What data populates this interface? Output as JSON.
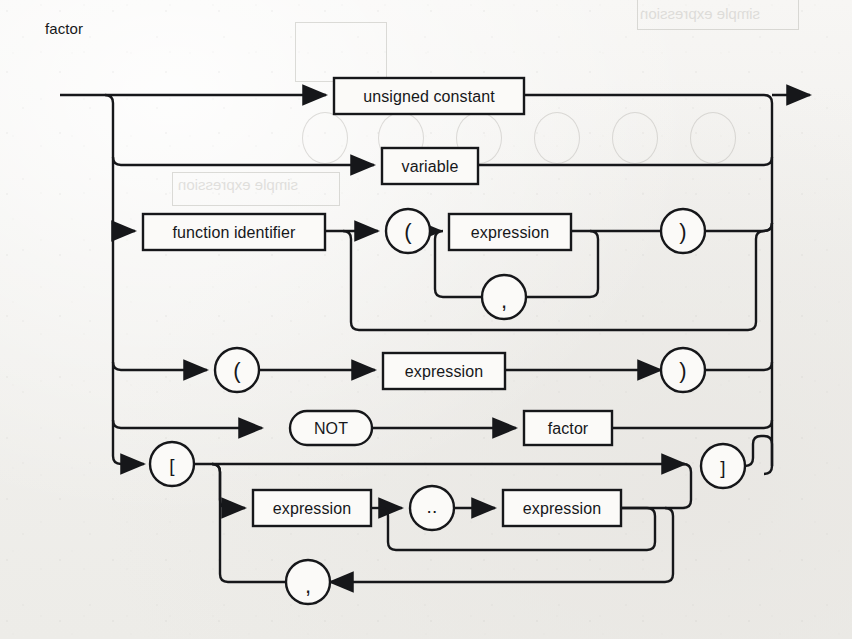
{
  "diagram": {
    "type": "syntax-railroad-diagram",
    "title": "factor",
    "title_pos": {
      "x": 45,
      "y": 27
    },
    "canvas": {
      "width": 852,
      "height": 639
    },
    "ink_color": "#16171a",
    "paper_color": "#f2f2f0",
    "entry": {
      "x": 60,
      "y": 95
    },
    "exit": {
      "x": 818,
      "y": 95
    },
    "left_rail_x": 113,
    "right_rail_x": 772,
    "alternatives": [
      {
        "id": "alt-unsigned-constant",
        "row_y": 95,
        "label": "unsigned constant"
      },
      {
        "id": "alt-variable",
        "row_y": 165,
        "label": "variable"
      },
      {
        "id": "alt-function-call",
        "row_y": 231,
        "label": "function identifier"
      },
      {
        "id": "alt-paren-expression",
        "row_y": 370,
        "label": "expression"
      },
      {
        "id": "alt-not-factor",
        "row_y": 428,
        "label": "NOT"
      },
      {
        "id": "alt-set-constructor",
        "row_y": 464,
        "label": "["
      }
    ],
    "nodes": [
      {
        "id": "node-unsigned-constant",
        "kind": "box",
        "label": "unsigned constant",
        "x": 334,
        "y": 78,
        "w": 190,
        "h": 36
      },
      {
        "id": "node-variable",
        "kind": "box",
        "label": "variable",
        "x": 382,
        "y": 148,
        "w": 96,
        "h": 36
      },
      {
        "id": "node-function-identifier",
        "kind": "box",
        "label": "function identifier",
        "x": 143,
        "y": 214,
        "w": 182,
        "h": 36
      },
      {
        "id": "node-lparen-call",
        "kind": "circle",
        "label": "(",
        "cx": 408,
        "cy": 231,
        "r": 22
      },
      {
        "id": "node-expression-arg",
        "kind": "box",
        "label": "expression",
        "x": 449,
        "y": 214,
        "w": 122,
        "h": 36
      },
      {
        "id": "node-comma-arg",
        "kind": "circle",
        "label": ",",
        "cx": 504,
        "cy": 297,
        "r": 22
      },
      {
        "id": "node-rparen-call",
        "kind": "circle",
        "label": ")",
        "cx": 683,
        "cy": 231,
        "r": 22
      },
      {
        "id": "node-lparen-group",
        "kind": "circle",
        "label": "(",
        "cx": 237,
        "cy": 370,
        "r": 22
      },
      {
        "id": "node-expression-group",
        "kind": "box",
        "label": "expression",
        "x": 383,
        "y": 353,
        "w": 122,
        "h": 36
      },
      {
        "id": "node-rparen-group",
        "kind": "circle",
        "label": ")",
        "cx": 683,
        "cy": 370,
        "r": 22
      },
      {
        "id": "node-not",
        "kind": "stadium",
        "label": "NOT",
        "x": 290,
        "y": 411,
        "w": 82,
        "h": 34
      },
      {
        "id": "node-factor",
        "kind": "box",
        "label": "factor",
        "x": 524,
        "y": 411,
        "w": 88,
        "h": 34
      },
      {
        "id": "node-lbracket",
        "kind": "circle",
        "label": "[",
        "cx": 172,
        "cy": 464,
        "r": 22
      },
      {
        "id": "node-expression-low",
        "kind": "box",
        "label": "expression",
        "x": 253,
        "y": 490,
        "w": 118,
        "h": 36
      },
      {
        "id": "node-range-dots",
        "kind": "circle",
        "label": "..",
        "cx": 432,
        "cy": 508,
        "r": 22
      },
      {
        "id": "node-expression-high",
        "kind": "box",
        "label": "expression",
        "x": 503,
        "y": 490,
        "w": 118,
        "h": 36
      },
      {
        "id": "node-comma-set",
        "kind": "circle",
        "label": ",",
        "cx": 308,
        "cy": 582,
        "r": 22
      },
      {
        "id": "node-rbracket",
        "kind": "circle",
        "label": "]",
        "cx": 723,
        "cy": 466,
        "r": 22
      }
    ],
    "terminals": [
      "(",
      ")",
      ",",
      "[",
      "]",
      "..",
      "NOT"
    ],
    "nonterminals": [
      "unsigned constant",
      "variable",
      "function identifier",
      "expression",
      "factor"
    ]
  },
  "bleedthrough": [
    {
      "text": "simple expression",
      "x": 620,
      "y": 10,
      "size": 15
    },
    {
      "text": "simple expression",
      "x": 175,
      "y": 178,
      "size": 15
    }
  ]
}
